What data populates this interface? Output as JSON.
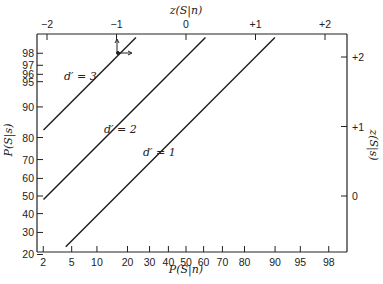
{
  "chart_data": {
    "type": "line",
    "title": "",
    "xlabel": "P(S|n)",
    "ylabel": "P(S|s)",
    "x2label": "z(S|n)",
    "y2label": "z(S|s)",
    "x_scale": "normal-probability",
    "y_scale": "normal-probability",
    "x_ticks": [
      "2",
      "5",
      "10",
      "20",
      "30",
      "40",
      "50",
      "60",
      "70",
      "80",
      "90",
      "95",
      "98"
    ],
    "y_ticks": [
      "20",
      "30",
      "40",
      "50",
      "60",
      "70",
      "80",
      "90",
      "95",
      "96",
      "97",
      "98"
    ],
    "x2_ticks": [
      "−2",
      "−1",
      "0",
      "+1",
      "+2"
    ],
    "y2_ticks": [
      "0",
      "+1",
      "+2"
    ],
    "xlim_z": [
      -2.05,
      2.3
    ],
    "ylim_z": [
      -0.8,
      2.35
    ],
    "grid": false,
    "legend": null,
    "series": [
      {
        "name": "d' = 3",
        "label": "d′ = 3",
        "z_n": [
          -2.05,
          -0.72
        ],
        "z_s": [
          0.95,
          2.28
        ]
      },
      {
        "name": "d' = 2",
        "label": "d′ = 2",
        "z_n": [
          -2.05,
          0.28
        ],
        "z_s": [
          -0.05,
          2.28
        ]
      },
      {
        "name": "d' = 1",
        "label": "d′ = 1",
        "z_n": [
          -1.73,
          1.28
        ],
        "z_s": [
          -0.73,
          2.28
        ]
      }
    ],
    "annotations": [
      {
        "type": "arrow-marker",
        "note": "point on d'=3 line near z(S|n)=-1 with arrows pointing up and right"
      }
    ]
  }
}
